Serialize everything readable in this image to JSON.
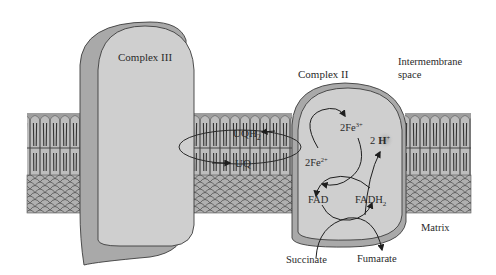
{
  "diagram": {
    "regions": {
      "intermembrane_space": [
        "Intermembrane",
        "space"
      ],
      "matrix": "Matrix"
    },
    "complexes": {
      "complex_iii": "Complex III",
      "complex_ii": "Complex II"
    },
    "ubiquinone_cycle": {
      "reduced": "UQH",
      "reduced_sub": "2",
      "oxidized": "UQ"
    },
    "iron_sulfur": {
      "oxidized": "2Fe",
      "oxidized_sup": "3+",
      "reduced": "2Fe",
      "reduced_sup": "2+"
    },
    "protons": {
      "coef": "2",
      "ion": "H",
      "sup": "+"
    },
    "flavin": {
      "oxidized": "FAD",
      "reduced": "FADH",
      "reduced_sub": "2"
    },
    "substrates": {
      "input": "Succinate",
      "output": "Fumarate"
    },
    "colors": {
      "protein_face": "#cfcfcf",
      "protein_side": "#a9a9a9",
      "membrane_head": "#b9b9b9",
      "membrane_tail": "#3a3a3a",
      "outline": "#3c3c3c",
      "proton_halo": "#a8a8a8"
    }
  }
}
